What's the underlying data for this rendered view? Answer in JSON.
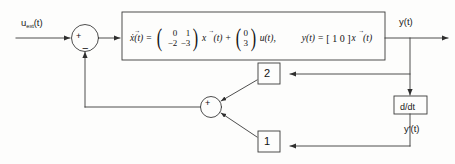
{
  "diagram": {
    "type": "control-block-diagram",
    "background_color": "#fdfdfc",
    "line_color": "#3a3a3a"
  },
  "signals": {
    "input_label_base": "u",
    "input_label_subscript": "ext",
    "input_label_suffix": "(t)",
    "input_label_full": "u_ext(t)",
    "output_label": "y(t)",
    "derivative_label": "y'(t)"
  },
  "plant_block": {
    "name": "state-space-equations",
    "state_equation": {
      "lhs": "ẋ(t)",
      "equals": "=",
      "A_matrix": {
        "rows": [
          [
            "0",
            "1"
          ],
          [
            "−2",
            "−3"
          ]
        ]
      },
      "state_vector": "x⃗(t)",
      "plus": "+",
      "B_vector": {
        "rows": [
          "0",
          "3"
        ]
      },
      "input_term": "u(t),"
    },
    "output_equation": {
      "lhs": "y(t)",
      "equals": "=",
      "C_matrix": "[ 1  0 ]",
      "state_vector": "x⃗(t)"
    }
  },
  "summing_junctions": [
    {
      "name": "input-summer",
      "signs": {
        "left_input": "+",
        "bottom_input": "−"
      }
    },
    {
      "name": "feedback-summer",
      "signs": {
        "center": "+"
      }
    }
  ],
  "gain_blocks": [
    {
      "name": "gain-top",
      "value": "2",
      "source": "y(t)"
    },
    {
      "name": "gain-bottom",
      "value": "1",
      "source": "y'(t)"
    }
  ],
  "derivative_block": {
    "name": "derivative",
    "label": "d/dt"
  }
}
